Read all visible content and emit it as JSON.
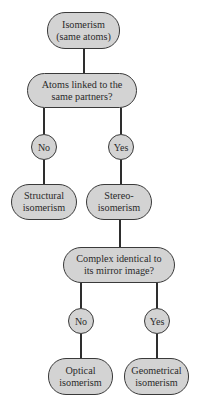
{
  "diagram": {
    "root": {
      "line1": "Isomerism",
      "line2": "(same atoms)"
    },
    "question1": {
      "line1": "Atoms linked to the",
      "line2": "same partners?"
    },
    "q1_no": "No",
    "q1_yes": "Yes",
    "structural": {
      "line1": "Structural",
      "line2": "isomerism"
    },
    "stereo": {
      "line1": "Stereo-",
      "line2": "isomerism"
    },
    "question2": {
      "line1": "Complex identical to",
      "line2": "its mirror image?"
    },
    "q2_no": "No",
    "q2_yes": "Yes",
    "optical": {
      "line1": "Optical",
      "line2": "isomerism"
    },
    "geometrical": {
      "line1": "Geometrical",
      "line2": "isomerism"
    },
    "colors": {
      "node_fill": "#d3d3d3",
      "outline": "#3a3a3a",
      "background": "#ffffff"
    }
  }
}
